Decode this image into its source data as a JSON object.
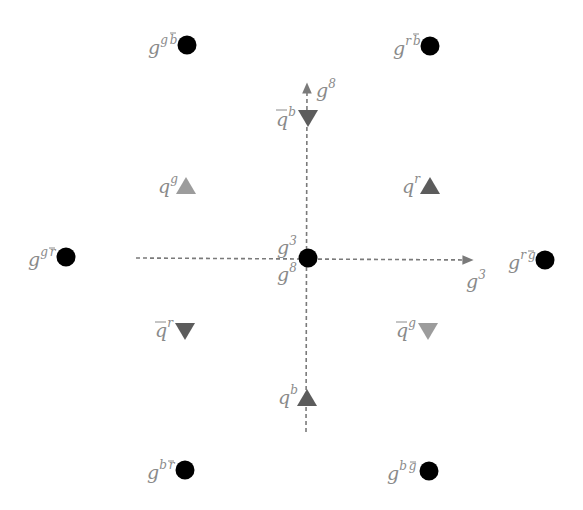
{
  "diagram": {
    "colors": {
      "gluon_dot": "#000000",
      "quark_dark": "#5c5c5c",
      "quark_light": "#9c9c9c",
      "axis": "#7a7a7a",
      "label": "#8a8a8a"
    },
    "axes": {
      "horizontal": {
        "label": "g",
        "sup": "3"
      },
      "vertical": {
        "label": "g",
        "sup": "8"
      }
    },
    "center": {
      "label_top": {
        "base": "g",
        "sup": "3"
      },
      "label_bottom": {
        "base": "g",
        "sup": "8"
      }
    },
    "gluons": [
      {
        "id": "g-g-bbar",
        "base": "g",
        "sup1": "g",
        "sup2": "b",
        "bar2": true,
        "x": 187,
        "y": 45
      },
      {
        "id": "g-r-bbar",
        "base": "g",
        "sup1": "r",
        "sup2": "b",
        "bar2": true,
        "x": 430,
        "y": 46
      },
      {
        "id": "g-g-rbar",
        "base": "g",
        "sup1": "g",
        "sup2": "r",
        "bar2": true,
        "x": 66,
        "y": 257
      },
      {
        "id": "g-r-gbar",
        "base": "g",
        "sup1": "r",
        "sup2": "g",
        "bar2": true,
        "x": 545,
        "y": 260
      },
      {
        "id": "g-b-rbar",
        "base": "g",
        "sup1": "b",
        "sup2": "r",
        "bar2": true,
        "x": 185,
        "y": 470
      },
      {
        "id": "g-b-gbar",
        "base": "g",
        "sup1": "b",
        "sup2": "g",
        "bar2": true,
        "x": 429,
        "y": 471
      }
    ],
    "quarks": [
      {
        "id": "qbar-b",
        "base": "q",
        "sup": "b",
        "anti": true,
        "dir": "down",
        "shade": "dark",
        "x": 308,
        "y": 118
      },
      {
        "id": "q-g",
        "base": "q",
        "sup": "g",
        "anti": false,
        "dir": "up",
        "shade": "light",
        "x": 186,
        "y": 186
      },
      {
        "id": "q-r",
        "base": "q",
        "sup": "r",
        "anti": false,
        "dir": "up",
        "shade": "dark",
        "x": 430,
        "y": 186
      },
      {
        "id": "qbar-r",
        "base": "q",
        "sup": "r",
        "anti": true,
        "dir": "down",
        "shade": "dark",
        "x": 185,
        "y": 331
      },
      {
        "id": "qbar-g",
        "base": "q",
        "sup": "g",
        "anti": true,
        "dir": "down",
        "shade": "light",
        "x": 428,
        "y": 331
      },
      {
        "id": "q-b",
        "base": "q",
        "sup": "b",
        "anti": false,
        "dir": "up",
        "shade": "dark",
        "x": 307,
        "y": 398
      }
    ]
  }
}
